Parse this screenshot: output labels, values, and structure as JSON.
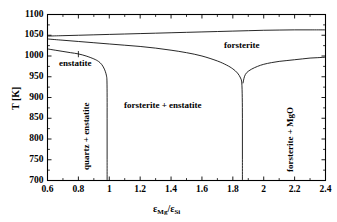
{
  "figure": {
    "background_color": "#ffffff",
    "line_color": "#000000",
    "frame_color": "#000000"
  },
  "axes": {
    "x_title_eps": "ε",
    "x_title_mg": "Mg",
    "x_title_slash": "/ε",
    "x_title_si": "Si",
    "y_title": "T [K]"
  },
  "labels": {
    "forsterite": "forsterite",
    "enstatite": "enstatite",
    "forsterite_enstatite": "forsterite + enstatite",
    "quartz_enstatite": "quartz + enstatite",
    "forsterite_mgo": "forsterite + MgO"
  },
  "ticks": {
    "x": [
      "0.6",
      "0.8",
      "1",
      "1.2",
      "1.4",
      "1.6",
      "1.8",
      "2",
      "2.2",
      "2.4"
    ],
    "y": [
      "700",
      "750",
      "800",
      "850",
      "900",
      "950",
      "1000",
      "1050",
      "1100"
    ]
  },
  "chart_data": {
    "type": "line",
    "title": "",
    "xlabel": "εMg/εSi",
    "ylabel": "T [K]",
    "xlim": [
      0.6,
      2.4
    ],
    "ylim": [
      700,
      1100
    ],
    "xticks": [
      0.6,
      0.8,
      1.0,
      1.2,
      1.4,
      1.6,
      1.8,
      2.0,
      2.2,
      2.4
    ],
    "yticks": [
      700,
      750,
      800,
      850,
      900,
      950,
      1000,
      1050,
      1100
    ],
    "grid": false,
    "legend": null,
    "annotations": [
      {
        "text": "forsterite",
        "x": 1.95,
        "y": 1028
      },
      {
        "text": "enstatite",
        "x": 0.78,
        "y": 985
      },
      {
        "text": "forsterite + enstatite",
        "x": 1.42,
        "y": 880
      },
      {
        "text": "quartz + enstatite",
        "x": 0.81,
        "y": 840,
        "rotation": 90
      },
      {
        "text": "forsterite + MgO",
        "x": 2.15,
        "y": 855,
        "rotation": 90
      }
    ],
    "series": [
      {
        "name": "upper-condensation-curve",
        "comment": "topmost nearly-flat curve rising slightly to the right",
        "points": [
          [
            0.6,
            1048
          ],
          [
            0.7,
            1049
          ],
          [
            0.8,
            1050
          ],
          [
            0.9,
            1051
          ],
          [
            1.0,
            1052
          ],
          [
            1.1,
            1053
          ],
          [
            1.2,
            1054
          ],
          [
            1.3,
            1055
          ],
          [
            1.4,
            1056
          ],
          [
            1.5,
            1057
          ],
          [
            1.6,
            1058
          ],
          [
            1.7,
            1059
          ],
          [
            1.8,
            1060
          ],
          [
            1.9,
            1061
          ],
          [
            2.0,
            1062
          ],
          [
            2.1,
            1062.5
          ],
          [
            2.2,
            1063
          ],
          [
            2.3,
            1063
          ],
          [
            2.4,
            1063
          ]
        ]
      },
      {
        "name": "forsterite-lower-boundary",
        "comment": "curve from left edge ~1041 K descending to cusp at x=1.86",
        "points": [
          [
            0.6,
            1041
          ],
          [
            0.7,
            1038
          ],
          [
            0.8,
            1035
          ],
          [
            0.9,
            1032
          ],
          [
            1.0,
            1029
          ],
          [
            1.1,
            1026
          ],
          [
            1.2,
            1023
          ],
          [
            1.3,
            1019
          ],
          [
            1.4,
            1014
          ],
          [
            1.5,
            1008
          ],
          [
            1.6,
            1000
          ],
          [
            1.7,
            988
          ],
          [
            1.76,
            978
          ],
          [
            1.8,
            969
          ],
          [
            1.83,
            959
          ],
          [
            1.85,
            947
          ],
          [
            1.858,
            935
          ],
          [
            1.861,
            900
          ],
          [
            1.862,
            850
          ],
          [
            1.862,
            800
          ],
          [
            1.862,
            750
          ],
          [
            1.862,
            700
          ]
        ]
      },
      {
        "name": "enstatite-lower-boundary",
        "comment": "curve from left edge ~1017 K falling to vertical line at x=0.985",
        "points": [
          [
            0.6,
            1017
          ],
          [
            0.65,
            1014
          ],
          [
            0.7,
            1011
          ],
          [
            0.75,
            1008
          ],
          [
            0.8,
            1005
          ],
          [
            0.85,
            1000
          ],
          [
            0.9,
            993
          ],
          [
            0.93,
            987
          ],
          [
            0.95,
            980
          ],
          [
            0.965,
            971
          ],
          [
            0.975,
            962
          ],
          [
            0.982,
            952
          ],
          [
            0.985,
            940
          ],
          [
            0.986,
            900
          ],
          [
            0.986,
            850
          ],
          [
            0.986,
            800
          ],
          [
            0.986,
            750
          ],
          [
            0.986,
            700
          ]
        ]
      },
      {
        "name": "mgo-boundary",
        "comment": "curve rising from the cusp at x=1.86 toward the right edge",
        "points": [
          [
            1.866,
            935
          ],
          [
            1.875,
            950
          ],
          [
            1.89,
            960
          ],
          [
            1.92,
            968
          ],
          [
            1.96,
            975
          ],
          [
            2.0,
            980
          ],
          [
            2.05,
            984
          ],
          [
            2.1,
            987
          ],
          [
            2.15,
            989
          ],
          [
            2.2,
            991
          ],
          [
            2.25,
            993
          ],
          [
            2.3,
            995
          ],
          [
            2.35,
            996
          ],
          [
            2.4,
            997
          ]
        ]
      }
    ],
    "tick_marker_segment": {
      "comment": "short vertical tick drawn on the enstatite curve near x=0.80",
      "x": 0.8,
      "y_top": 1012,
      "y_bottom": 997
    }
  }
}
